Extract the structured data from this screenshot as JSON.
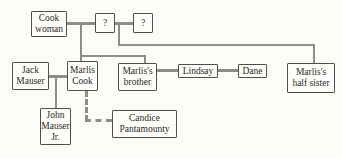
{
  "diagram": {
    "type": "family-tree",
    "nodes": {
      "cook_woman": "Cook\nwoman",
      "unknown_1": "?",
      "unknown_2": "?",
      "jack_mauser": "Jack\nMauser",
      "marlis_cook": "Marlis\nCook",
      "marlis_brother": "Marlis's\nbrother",
      "lindsay": "Lindsay",
      "dane": "Dane",
      "marlis_half_sister": "Marlis's\nhalf sister",
      "john_mauser_jr": "John\nMauser\nJr.",
      "candice_pantamounty": "Candice\nPantamounty"
    },
    "edges": [
      {
        "from": "cook_woman",
        "to": "unknown_1",
        "type": "union"
      },
      {
        "from": "unknown_1",
        "to": "unknown_2",
        "type": "union"
      },
      {
        "parents": [
          "cook_woman",
          "unknown_1"
        ],
        "children": [
          "marlis_cook",
          "marlis_brother"
        ],
        "type": "descent"
      },
      {
        "parents": [
          "unknown_1",
          "unknown_2"
        ],
        "children": [
          "marlis_half_sister"
        ],
        "type": "descent"
      },
      {
        "from": "jack_mauser",
        "to": "marlis_cook",
        "type": "union"
      },
      {
        "parents": [
          "jack_mauser",
          "marlis_cook"
        ],
        "children": [
          "john_mauser_jr"
        ],
        "type": "descent"
      },
      {
        "from": "marlis_brother",
        "to": "lindsay",
        "type": "union"
      },
      {
        "from": "lindsay",
        "to": "dane",
        "type": "union"
      },
      {
        "from": "marlis_cook",
        "to": "candice_pantamounty",
        "type": "dashed-link"
      }
    ],
    "colors": {
      "background": "#fcfcf9",
      "box_border": "#4f4f4b",
      "connector": "#8d8d8b",
      "text": "#2a2a27"
    }
  }
}
